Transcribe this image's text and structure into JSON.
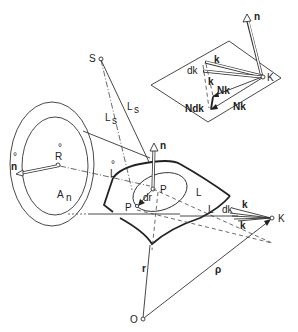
{
  "diagram": {
    "type": "geometric optics / radiometry vector diagram",
    "labels": {
      "S": "S",
      "Ls": "L",
      "Ls_sub": "s",
      "Ls_bar": "L",
      "Ls_bar_sub": "s",
      "R": "R",
      "n_ring": "n",
      "A": "A",
      "A_sub": "n",
      "L_ring": "L",
      "n_top": "n",
      "n_surface": "n",
      "P": "P",
      "P_bar": "P",
      "dr": "dr",
      "L_right": "L",
      "L_lower": "L",
      "dk_lower": "dk",
      "k_upper": "k",
      "k_lower": "k",
      "K_lower": "K",
      "r": "r",
      "rho": "ρ",
      "O": "O",
      "inset_dk": "dk",
      "inset_k1": "k",
      "inset_k2": "k",
      "inset_K": "K",
      "inset_Nk": "Nk",
      "inset_Ndk": "Ndk",
      "inset_Nk_bar": "Nk"
    },
    "points": [
      "S",
      "R",
      "P",
      "P̄",
      "K",
      "O"
    ],
    "vectors": [
      "n",
      "k",
      "k̄",
      "dk",
      "dr",
      "r",
      "ρ",
      "Nk",
      "Ndk",
      "Nk̄"
    ]
  }
}
